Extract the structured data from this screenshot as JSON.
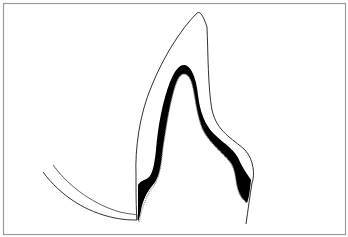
{
  "diagram": {
    "title": "",
    "colors": {
      "background": "#ffffff",
      "frame": "#9a9a9a",
      "outline": "#1a1a1a",
      "band": "#000000",
      "dotted_edge": "#8c8c8c"
    },
    "frame": {
      "x": 3.5,
      "y": 3.5,
      "w": 342,
      "h": 231
    },
    "paths": {
      "outer_outline": "M137 220 C136 208 136 190 136 175 C135 150 139 115 152 85 C163 58 180 30 197 13 C200 11 203 15 207 27 C208 50 208 90 212 110 C217 132 232 138 245 150 C254 160 255 175 252 183 C250 195 248 210 246 224",
      "band_shape": "M138 185 C140 181 145 180 148 178 C151 176 154 170 156 150 C158 125 163 100 170 82 C174 72 179 64 185 65 C191 67 196 76 198 95 C200 112 205 125 214 134 C224 144 236 150 240 162 C244 170 248 175 251 180 C250 190 249 198 247 203 C243 200 240 196 238 190 C235 180 236 170 230 162 C222 152 208 142 202 128 C196 112 195 95 192 84 C190 77 187 74 184 74 C180 74 177 80 174 90 C169 108 166 128 163 148 C161 165 160 178 152 186 C147 192 143 200 141 210 C140 216 139 219 138 222 Z",
      "inner_dotted": "M139 222 C141 212 145 198 152 188 C159 180 161 168 163 148 C166 128 169 108 174 90 C177 80 180 74 184 74 C187 74 190 77 192 84 C195 95 196 112 202 128 C208 142 222 152 230 162 C236 170 235 180 238 190 C240 196 243 200 247 203",
      "gum_outer": "M43 172 C60 195 85 212 115 218 C125 220 132 220 137 220",
      "gum_inner": "M53 165 C70 188 95 205 120 212 C128 214 134 214 137 215 L137 220"
    }
  }
}
